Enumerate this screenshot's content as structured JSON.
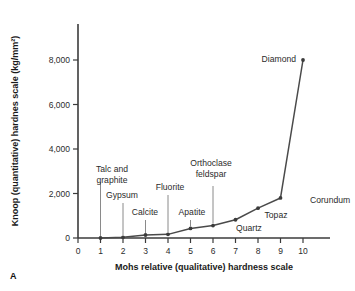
{
  "figure": {
    "panel_label": "A"
  },
  "chart_data": {
    "type": "line",
    "title": "",
    "xlabel": "Mohs relative (qualitative) hardness scale",
    "ylabel": "Knoop (quantitative) hardnes scale (kg/mm²)",
    "xlim": [
      0,
      10
    ],
    "ylim": [
      0,
      9000
    ],
    "grid": false,
    "legend": "none",
    "xticks": [
      "0",
      "1",
      "2",
      "3",
      "4",
      "5",
      "6",
      "7",
      "8",
      "9",
      "10"
    ],
    "xtick_values": [
      0,
      1,
      2,
      3,
      4,
      5,
      6,
      7,
      8,
      9,
      10
    ],
    "yticks": [
      "0",
      "2,000",
      "4,000",
      "6,000",
      "8,000"
    ],
    "ytick_values": [
      0,
      2000,
      4000,
      6000,
      8000
    ],
    "x": [
      1,
      2,
      3,
      4,
      5,
      6,
      7,
      8,
      9,
      10
    ],
    "values": [
      1,
      32,
      135,
      163,
      430,
      560,
      820,
      1340,
      1800,
      8000
    ],
    "point_labels": [
      "Talc and graphite",
      "Gypsum",
      "Calcite",
      "Fluorite",
      "Apatite",
      "Orthoclase feldspar",
      "Quartz",
      "Topaz",
      "Corundum",
      "Diamond"
    ],
    "annotations": [
      {
        "label_line1": "Talc and",
        "label_line2": "graphite",
        "x": 1,
        "y": 1
      },
      {
        "label_line1": "Gypsum",
        "label_line2": "",
        "x": 2,
        "y": 32
      },
      {
        "label_line1": "Calcite",
        "label_line2": "",
        "x": 3,
        "y": 135
      },
      {
        "label_line1": "Fluorite",
        "label_line2": "",
        "x": 4,
        "y": 163
      },
      {
        "label_line1": "Apatite",
        "label_line2": "",
        "x": 5,
        "y": 430
      },
      {
        "label_line1": "Orthoclase",
        "label_line2": "feldspar",
        "x": 6,
        "y": 560
      },
      {
        "label_line1": "Quartz",
        "label_line2": "",
        "x": 7,
        "y": 820
      },
      {
        "label_line1": "Topaz",
        "label_line2": "",
        "x": 8,
        "y": 1340
      },
      {
        "label_line1": "Corundum",
        "label_line2": "",
        "x": 9,
        "y": 1800
      },
      {
        "label_line1": "Diamond",
        "label_line2": "",
        "x": 10,
        "y": 8000
      }
    ],
    "colors": {
      "line": "#4a4a4a",
      "point": "#3b3b3b",
      "axis": "#3b3b3b",
      "leader": "#8a8a8a",
      "background": "#ffffff"
    }
  }
}
